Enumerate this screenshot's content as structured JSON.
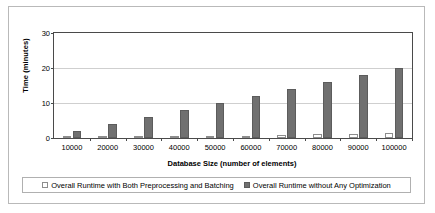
{
  "chart_data": {
    "type": "bar",
    "title": "",
    "xlabel": "Database Size (number of elements)",
    "ylabel": "Time (minutes)",
    "categories": [
      "10000",
      "20000",
      "30000",
      "40000",
      "50000",
      "60000",
      "70000",
      "80000",
      "90000",
      "100000"
    ],
    "series": [
      {
        "name": "Overall Runtime with Both Preprocessing and Batching",
        "color": "#ffffff",
        "values": [
          0.2,
          0.3,
          0.4,
          0.5,
          0.6,
          0.7,
          0.9,
          1.1,
          1.2,
          1.3
        ]
      },
      {
        "name": "Overall Runtime without Any Optimization",
        "color": "#707070",
        "values": [
          2,
          4,
          6,
          8,
          10,
          12,
          14,
          16,
          18,
          20
        ]
      }
    ],
    "ylim": [
      0,
      30
    ],
    "yticks": [
      "0",
      "10",
      "20",
      "30"
    ],
    "ytick_values": [
      0,
      10,
      20,
      30
    ],
    "grid": "horizontal",
    "legend_position": "bottom"
  },
  "legend": {
    "entries": [
      {
        "label": "Overall Runtime with Both Preprocessing and Batching",
        "swatch": "light-square-icon"
      },
      {
        "label": "Overall Runtime without Any Optimization",
        "swatch": "dark-square-icon"
      }
    ]
  }
}
